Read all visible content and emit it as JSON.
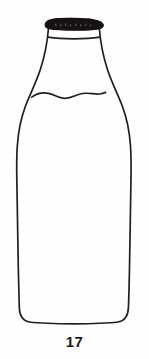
{
  "figure": {
    "caption": "17",
    "background_color": "#fefefe",
    "line_color": "#231f20",
    "cap_color": "#161213",
    "parts": {
      "cap": "bottle-cap",
      "rim": "bottle-rim-line",
      "neck": "bottle-neck",
      "shoulder": "bottle-shoulder",
      "liquid_level": "milk-level-wavy-line",
      "body": "bottle-body",
      "base": "bottle-base"
    }
  }
}
